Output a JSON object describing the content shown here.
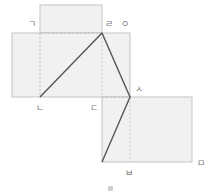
{
  "diagram": {
    "labels": {
      "giyeok": "ㄱ",
      "nieun": "ㄴ",
      "digeut": "ㄷ",
      "rieul": "ㄹ",
      "mieum": "ㅁ",
      "bieup": "ㅂ",
      "siot": "ㅅ",
      "ieung": "ㅇ"
    },
    "colors": {
      "fill": "#f1f1f1",
      "border": "#c4c4c4",
      "dashed": "#c8c8c8",
      "path": "#555555",
      "label": "#777777",
      "marker": "#d0d0d0"
    }
  }
}
